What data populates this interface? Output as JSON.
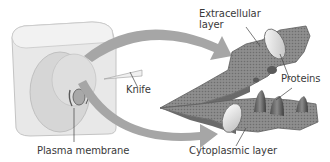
{
  "diagram": {
    "labels": {
      "extracellular_layer_line1": "Extracellular",
      "extracellular_layer_line2": "layer",
      "knife": "Knife",
      "proteins": "Proteins",
      "plasma_membrane": "Plasma membrane",
      "cytoplasmic_layer": "Cytoplasmic layer"
    },
    "colors": {
      "block": "#e6e6e6",
      "block_shadow": "#cfcfcf",
      "arrow": "#9a9a9a",
      "membrane": "#8c8c8c",
      "membrane_dark": "#5e5e5e",
      "protein_disc": "#ececec",
      "protein_cone": "#6a6a6a",
      "text": "#3a3a3a"
    }
  }
}
